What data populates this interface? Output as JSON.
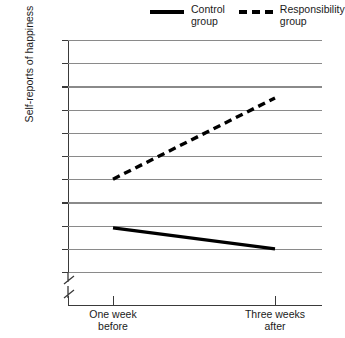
{
  "chart_data": {
    "type": "line",
    "title": "",
    "xlabel": "",
    "ylabel": "Self-reports of happiness",
    "categories": [
      "One week\nbefore",
      "Three weeks\nafter"
    ],
    "ylim": [
      4.7,
      5.7
    ],
    "ytick_labels": [
      "5.70",
      "5.60",
      "5.50",
      "5.40",
      "5.30",
      "5.20",
      "5.10",
      "5.00",
      "4.90",
      "4.80",
      "4.70"
    ],
    "ytick_values": [
      5.7,
      5.6,
      5.5,
      5.4,
      5.3,
      5.2,
      5.1,
      5.0,
      4.9,
      4.8,
      4.7
    ],
    "ytick_step": 0.1,
    "axis_break": true,
    "grid": true,
    "legend_position": "top",
    "series": [
      {
        "name": "Control\ngroup",
        "style": "solid",
        "color": "#000000",
        "values": [
          4.89,
          4.8
        ]
      },
      {
        "name": "Responsibility\ngroup",
        "style": "dashed",
        "color": "#000000",
        "values": [
          5.1,
          5.45
        ]
      }
    ]
  },
  "legend": {
    "items": [
      {
        "label": "Control\ngroup",
        "swatch": "solid-line-swatch"
      },
      {
        "label": "Responsibility\ngroup",
        "swatch": "dashed-line-swatch"
      }
    ]
  },
  "axes": {
    "y_title": "Self-reports of happiness",
    "y_ticks": [
      "5.70",
      "5.60",
      "5.50",
      "5.40",
      "5.30",
      "5.20",
      "5.10",
      "5.00",
      "4.90",
      "4.80",
      "4.70"
    ],
    "x_ticks": [
      "One week\nbefore",
      "Three weeks\nafter"
    ]
  }
}
